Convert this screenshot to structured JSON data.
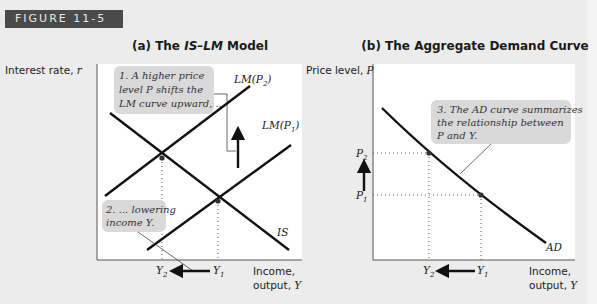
{
  "figure_label": "FIGURE 11-5",
  "panel_a": {
    "title_prefix": "(a) The ",
    "title_italic": "IS–LM",
    "title_suffix": " Model",
    "y_axis_label_text": "Interest rate, ",
    "y_axis_label_var": "r",
    "x_axis_label_line1": "Income,",
    "x_axis_label_line2_text": "output, ",
    "x_axis_label_line2_var": "Y",
    "curves": {
      "lm_p2": "LM(P",
      "lm_p2_sub": "2",
      "lm_p1": "LM(P",
      "lm_p1_sub": "1",
      "is": "IS"
    },
    "x_ticks": {
      "y2": "Y",
      "y2_sub": "2",
      "y1": "Y",
      "y1_sub": "1"
    },
    "annotation_1": [
      "1. A higher price",
      "level P shifts the",
      "LM curve upward, ..."
    ],
    "annotation_2": [
      "2. ... lowering",
      "income Y."
    ]
  },
  "panel_b": {
    "title": "(b) The Aggregate Demand Curve",
    "y_axis_label_text": "Price level, ",
    "y_axis_label_var": "P",
    "x_axis_label_line1": "Income,",
    "x_axis_label_line2_text": "output, ",
    "x_axis_label_line2_var": "Y",
    "curve": "AD",
    "y_ticks": {
      "p2": "P",
      "p2_sub": "2",
      "p1": "P",
      "p1_sub": "1"
    },
    "x_ticks": {
      "y2": "Y",
      "y2_sub": "2",
      "y1": "Y",
      "y1_sub": "1"
    },
    "annotation_3": [
      "3. The AD curve summarizes",
      "the relationship between",
      "P and Y."
    ]
  },
  "colors": {
    "background": "#ececec",
    "plot_area": "#ffffff",
    "callout": "#d9d9d9",
    "label_bar": "#4a4a4a"
  }
}
